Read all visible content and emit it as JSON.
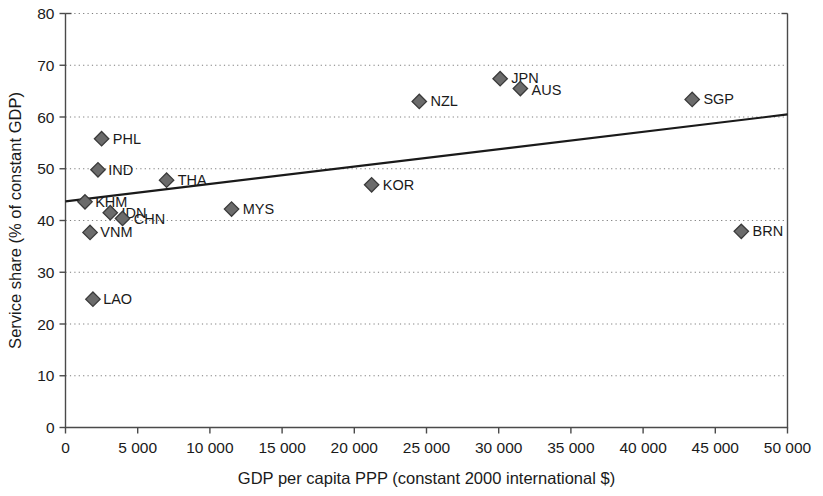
{
  "chart_data": {
    "type": "scatter",
    "title": "",
    "xlabel": "GDP per capita PPP (constant 2000 international $)",
    "ylabel": "Service share (% of constant GDP)",
    "xlim": [
      0,
      50000
    ],
    "ylim": [
      0,
      80
    ],
    "xticks": [
      0,
      5000,
      10000,
      15000,
      20000,
      25000,
      30000,
      35000,
      40000,
      45000,
      50000
    ],
    "xtick_labels": [
      "0",
      "5 000",
      "10 000",
      "15 000",
      "20 000",
      "25 000",
      "30 000",
      "35 000",
      "40 000",
      "45 000",
      "50 000"
    ],
    "yticks": [
      0,
      10,
      20,
      30,
      40,
      50,
      60,
      70,
      80
    ],
    "ytick_labels": [
      "0",
      "10",
      "20",
      "30",
      "40",
      "50",
      "60",
      "70",
      "80"
    ],
    "grid": "horizontal-dotted",
    "legend": "none",
    "marker": "diamond",
    "marker_color": "#6b6b6b",
    "marker_edge_color": "#3a3a3a",
    "line_color": "#1a1a1a",
    "points": [
      {
        "label": "KHM",
        "x": 1350,
        "y": 43.6,
        "label_dx": 10,
        "label_dy": 5
      },
      {
        "label": "LAO",
        "x": 1900,
        "y": 24.8,
        "label_dx": 10,
        "label_dy": 5
      },
      {
        "label": "VNM",
        "x": 1700,
        "y": 37.7,
        "label_dx": 10,
        "label_dy": 5
      },
      {
        "label": "PHL",
        "x": 2500,
        "y": 55.8,
        "label_dx": 11,
        "label_dy": 5
      },
      {
        "label": "IND",
        "x": 2250,
        "y": 49.8,
        "label_dx": 10,
        "label_dy": 5
      },
      {
        "label": "IDN",
        "x": 3100,
        "y": 41.5,
        "label_dx": 11,
        "label_dy": 5
      },
      {
        "label": "CHN",
        "x": 3950,
        "y": 40.4,
        "label_dx": 11,
        "label_dy": 6
      },
      {
        "label": "THA",
        "x": 7000,
        "y": 47.8,
        "label_dx": 11,
        "label_dy": 5
      },
      {
        "label": "MYS",
        "x": 11500,
        "y": 42.2,
        "label_dx": 11,
        "label_dy": 5
      },
      {
        "label": "KOR",
        "x": 21200,
        "y": 46.9,
        "label_dx": 11,
        "label_dy": 5
      },
      {
        "label": "NZL",
        "x": 24500,
        "y": 63.0,
        "label_dx": 11,
        "label_dy": 5
      },
      {
        "label": "JPN",
        "x": 30100,
        "y": 67.4,
        "label_dx": 11,
        "label_dy": 4
      },
      {
        "label": "AUS",
        "x": 31500,
        "y": 65.5,
        "label_dx": 11,
        "label_dy": 6
      },
      {
        "label": "SGP",
        "x": 43400,
        "y": 63.4,
        "label_dx": 11,
        "label_dy": 5
      },
      {
        "label": "BRN",
        "x": 46800,
        "y": 37.9,
        "label_dx": 11,
        "label_dy": 5
      }
    ],
    "trendline": {
      "x0": 0,
      "y0": 43.7,
      "x1": 50000,
      "y1": 60.5
    }
  }
}
